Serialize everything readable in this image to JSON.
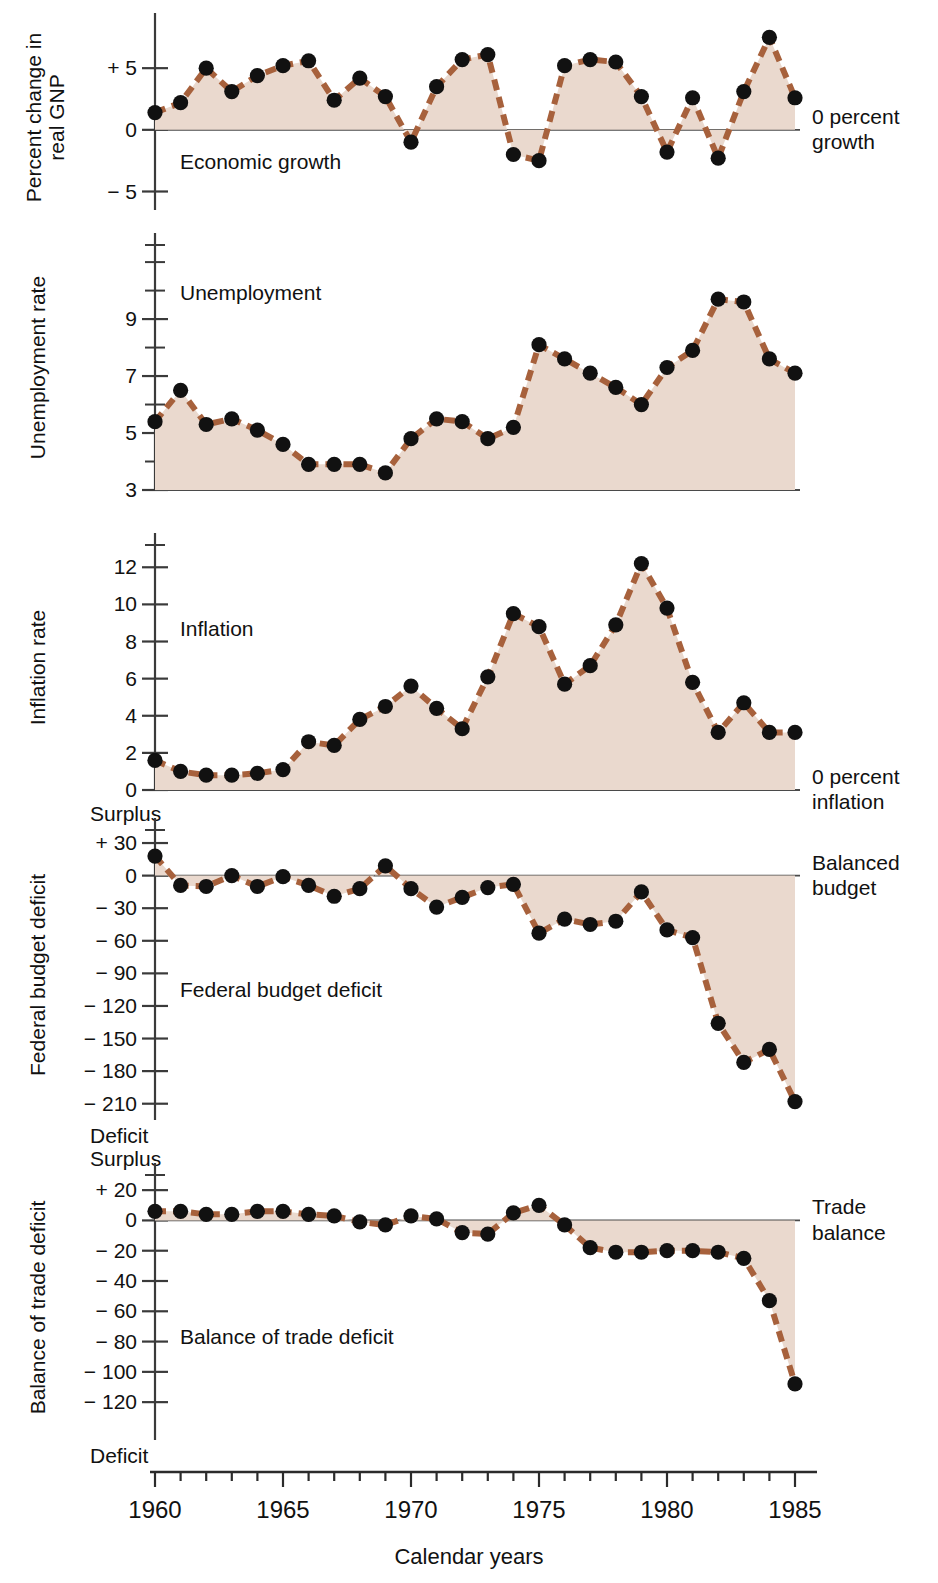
{
  "figure": {
    "x_axis_title": "Calendar years",
    "x_tick_labels": [
      "1960",
      "1965",
      "1970",
      "1975",
      "1980",
      "1985"
    ],
    "x_min": 1960,
    "x_max": 1985,
    "colors": {
      "line": "#a7613c",
      "fill": "#ead9ce",
      "marker": "#111111",
      "axis": "#3a3a3a",
      "rule": "#c1906f"
    }
  },
  "panels": [
    {
      "id": "economic-growth",
      "axis_title": "Percent change in\nreal GNP",
      "caption": "Economic growth",
      "note": "0 percent\ngrowth",
      "surplus_word": "",
      "deficit_word": "",
      "y_min": -6.5,
      "y_max": 8.5,
      "baseline": 0,
      "ticks": [
        {
          "v": 5,
          "label": "+ 5"
        },
        {
          "v": 0,
          "label": "0"
        },
        {
          "v": -5,
          "label": "− 5"
        }
      ],
      "minor_ticks": []
    },
    {
      "id": "unemployment",
      "axis_title": "Unemployment rate",
      "caption": "Unemployment",
      "note": "",
      "surplus_word": "",
      "deficit_word": "",
      "y_min": 3,
      "y_max": 11.6,
      "baseline": 3,
      "ticks": [
        {
          "v": 9,
          "label": "9"
        },
        {
          "v": 7,
          "label": "7"
        },
        {
          "v": 5,
          "label": "5"
        },
        {
          "v": 3,
          "label": "3"
        }
      ],
      "minor_ticks": [
        4,
        6,
        8,
        10,
        11,
        11.6
      ]
    },
    {
      "id": "inflation",
      "axis_title": "Inflation rate",
      "caption": "Inflation",
      "note": "0 percent\ninflation",
      "surplus_word": "",
      "deficit_word": "",
      "y_min": 0,
      "y_max": 13.2,
      "baseline": 0,
      "ticks": [
        {
          "v": 12,
          "label": "12"
        },
        {
          "v": 10,
          "label": "10"
        },
        {
          "v": 8,
          "label": "8"
        },
        {
          "v": 6,
          "label": "6"
        },
        {
          "v": 4,
          "label": "4"
        },
        {
          "v": 2,
          "label": "2"
        },
        {
          "v": 0,
          "label": "0"
        }
      ],
      "minor_ticks": [
        13.2
      ]
    },
    {
      "id": "federal-budget-deficit",
      "axis_title": "Federal budget deficit",
      "caption": "Federal budget deficit",
      "note": "Balanced\nbudget",
      "surplus_word": "Surplus",
      "deficit_word": "Deficit",
      "y_min": -225,
      "y_max": 42,
      "baseline": 0,
      "ticks": [
        {
          "v": 30,
          "label": "+ 30"
        },
        {
          "v": 0,
          "label": "0"
        },
        {
          "v": -30,
          "label": "− 30"
        },
        {
          "v": -60,
          "label": "− 60"
        },
        {
          "v": -90,
          "label": "− 90"
        },
        {
          "v": -120,
          "label": "− 120"
        },
        {
          "v": -150,
          "label": "− 150"
        },
        {
          "v": -180,
          "label": "− 180"
        },
        {
          "v": -210,
          "label": "− 210"
        }
      ],
      "minor_ticks": [
        42
      ]
    },
    {
      "id": "balance-of-trade-deficit",
      "axis_title": "Balance of trade deficit",
      "caption": "Balance of trade deficit",
      "note": "Trade\nbalance",
      "surplus_word": "Surplus",
      "deficit_word": "Deficit",
      "y_min": -145,
      "y_max": 30,
      "baseline": 0,
      "ticks": [
        {
          "v": 20,
          "label": "+ 20"
        },
        {
          "v": 0,
          "label": "0"
        },
        {
          "v": -20,
          "label": "− 20"
        },
        {
          "v": -40,
          "label": "− 40"
        },
        {
          "v": -60,
          "label": "− 60"
        },
        {
          "v": -80,
          "label": "− 80"
        },
        {
          "v": -100,
          "label": "− 100"
        },
        {
          "v": -120,
          "label": "− 120"
        }
      ],
      "minor_ticks": [
        30
      ]
    }
  ],
  "chart_data": [
    {
      "type": "line",
      "title": "Economic growth",
      "xlabel": "Calendar years",
      "ylabel": "Percent change in real GNP",
      "ylim": [
        -6.5,
        8.5
      ],
      "xlim": [
        1960,
        1985
      ],
      "grid": false,
      "baseline_label": "0 percent growth",
      "x": [
        1960,
        1961,
        1962,
        1963,
        1964,
        1965,
        1966,
        1967,
        1968,
        1969,
        1970,
        1971,
        1972,
        1973,
        1974,
        1975,
        1976,
        1977,
        1978,
        1979,
        1980,
        1981,
        1982,
        1983,
        1984,
        1985
      ],
      "values": [
        1.4,
        2.2,
        5.0,
        3.1,
        4.4,
        5.2,
        5.6,
        2.4,
        4.2,
        2.7,
        -1.0,
        3.5,
        5.7,
        6.1,
        -2.0,
        -2.5,
        5.2,
        5.7,
        5.5,
        2.7,
        -1.8,
        2.6,
        -2.3,
        3.1,
        7.5,
        2.6
      ]
    },
    {
      "type": "line",
      "title": "Unemployment",
      "xlabel": "Calendar years",
      "ylabel": "Unemployment rate",
      "ylim": [
        3,
        11.6
      ],
      "xlim": [
        1960,
        1985
      ],
      "grid": false,
      "x": [
        1960,
        1961,
        1962,
        1963,
        1964,
        1965,
        1966,
        1967,
        1968,
        1969,
        1970,
        1971,
        1972,
        1973,
        1974,
        1975,
        1976,
        1977,
        1978,
        1979,
        1980,
        1981,
        1982,
        1983,
        1984,
        1985
      ],
      "values": [
        5.4,
        6.5,
        5.3,
        5.5,
        5.1,
        4.6,
        3.9,
        3.9,
        3.9,
        3.6,
        4.8,
        5.5,
        5.4,
        4.8,
        5.2,
        8.1,
        7.6,
        7.1,
        6.6,
        6.0,
        7.3,
        7.9,
        9.7,
        9.6,
        7.6,
        7.1
      ]
    },
    {
      "type": "line",
      "title": "Inflation",
      "xlabel": "Calendar years",
      "ylabel": "Inflation rate",
      "ylim": [
        0,
        13.2
      ],
      "xlim": [
        1960,
        1985
      ],
      "grid": false,
      "baseline_label": "0 percent inflation",
      "x": [
        1960,
        1961,
        1962,
        1963,
        1964,
        1965,
        1966,
        1967,
        1968,
        1969,
        1970,
        1971,
        1972,
        1973,
        1974,
        1975,
        1976,
        1977,
        1978,
        1979,
        1980,
        1981,
        1982,
        1983,
        1984,
        1985
      ],
      "values": [
        1.6,
        1.0,
        0.8,
        0.8,
        0.9,
        1.1,
        2.6,
        2.4,
        3.8,
        4.5,
        5.6,
        4.4,
        3.3,
        6.1,
        9.5,
        8.8,
        5.7,
        6.7,
        8.9,
        12.2,
        9.8,
        5.8,
        3.1,
        4.7,
        3.1,
        3.1
      ]
    },
    {
      "type": "line",
      "title": "Federal budget deficit",
      "xlabel": "Calendar years",
      "ylabel": "Federal budget deficit",
      "ylim": [
        -225,
        42
      ],
      "xlim": [
        1960,
        1985
      ],
      "grid": false,
      "baseline_label": "Balanced budget",
      "axis_top_word": "Surplus",
      "axis_bottom_word": "Deficit",
      "x": [
        1960,
        1961,
        1962,
        1963,
        1964,
        1965,
        1966,
        1967,
        1968,
        1969,
        1970,
        1971,
        1972,
        1973,
        1974,
        1975,
        1976,
        1977,
        1978,
        1979,
        1980,
        1981,
        1982,
        1983,
        1984,
        1985
      ],
      "values": [
        18,
        -9,
        -10,
        0,
        -10,
        -1,
        -9,
        -19,
        -12,
        9,
        -12,
        -29,
        -20,
        -11,
        -8,
        -53,
        -40,
        -45,
        -42,
        -15,
        -50,
        -57,
        -136,
        -172,
        -160,
        -208
      ]
    },
    {
      "type": "line",
      "title": "Balance of trade deficit",
      "xlabel": "Calendar years",
      "ylabel": "Balance of trade deficit",
      "ylim": [
        -145,
        30
      ],
      "xlim": [
        1960,
        1985
      ],
      "grid": false,
      "baseline_label": "Trade balance",
      "axis_top_word": "Surplus",
      "axis_bottom_word": "Deficit",
      "x": [
        1960,
        1961,
        1962,
        1963,
        1964,
        1965,
        1966,
        1967,
        1968,
        1969,
        1970,
        1971,
        1972,
        1973,
        1974,
        1975,
        1976,
        1977,
        1978,
        1979,
        1980,
        1981,
        1982,
        1983,
        1984,
        1985
      ],
      "values": [
        6,
        6,
        4,
        4,
        6,
        6,
        4,
        3,
        -1,
        -3,
        3,
        1,
        -8,
        -9,
        5,
        10,
        -3,
        -18,
        -21,
        -21,
        -20,
        -20,
        -21,
        -25,
        -53,
        -108,
        -137
      ]
    }
  ]
}
